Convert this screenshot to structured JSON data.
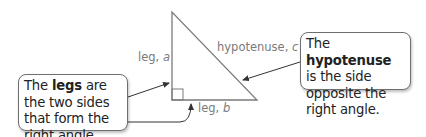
{
  "labels": {
    "leg_a": {
      "text": "leg, ",
      "var": "a"
    },
    "leg_b": {
      "text": "leg, ",
      "var": "b"
    },
    "hypotenuse": {
      "text": "hypotenuse, ",
      "var": "c"
    }
  },
  "callouts": {
    "legs": {
      "prefix": "The ",
      "bold": "legs",
      "suffix": " are the two sides that form the right angle."
    },
    "hypotenuse": {
      "prefix": "The ",
      "bold": "hypotenuse",
      "suffix": " is the side opposite the right angle."
    }
  },
  "colors": {
    "triangle_stroke": "#7a7a7a",
    "arrow_stroke": "#333333",
    "label_text": "#7a7a7a"
  }
}
